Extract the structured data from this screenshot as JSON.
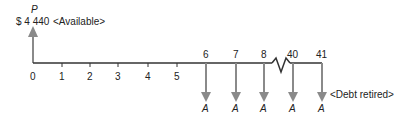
{
  "top": {
    "variable": "P",
    "amount": "$ 4 440",
    "note": "<Available>"
  },
  "axis": {
    "ticks": [
      "0",
      "1",
      "2",
      "3",
      "4",
      "5"
    ],
    "payment_periods": [
      "6",
      "7",
      "8",
      "40",
      "41"
    ]
  },
  "payments": {
    "symbol": "A",
    "note": "<Debt retired>"
  },
  "colors": {
    "arrow": "#8a8a8a",
    "line": "#333333"
  }
}
